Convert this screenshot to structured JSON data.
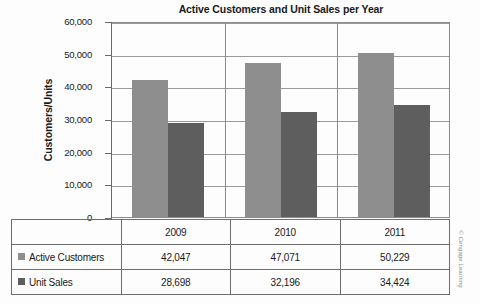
{
  "chart_data": {
    "type": "bar",
    "title": "Active Customers and Unit Sales per Year",
    "xlabel": "",
    "ylabel": "Customers/Units",
    "categories": [
      "2009",
      "2010",
      "2011"
    ],
    "series": [
      {
        "name": "Active Customers",
        "values": [
          42047,
          47071,
          50229
        ],
        "color": "#8e8e8e"
      },
      {
        "name": "Unit Sales",
        "values": [
          28698,
          32196,
          34424
        ],
        "color": "#5e5e5e"
      }
    ],
    "value_labels": [
      [
        "42,047",
        "47,071",
        "50,229"
      ],
      [
        "28,698",
        "32,196",
        "34,424"
      ]
    ],
    "ylim": [
      0,
      60000
    ],
    "ytick_values": [
      0,
      10000,
      20000,
      30000,
      40000,
      50000,
      60000
    ],
    "ytick_labels": [
      "0",
      "10,000",
      "20,000",
      "30,000",
      "40,000",
      "50,000",
      "60,000"
    ],
    "grid": true,
    "legend_position": "table-row-labels"
  },
  "credit": "© Cengage Learning"
}
